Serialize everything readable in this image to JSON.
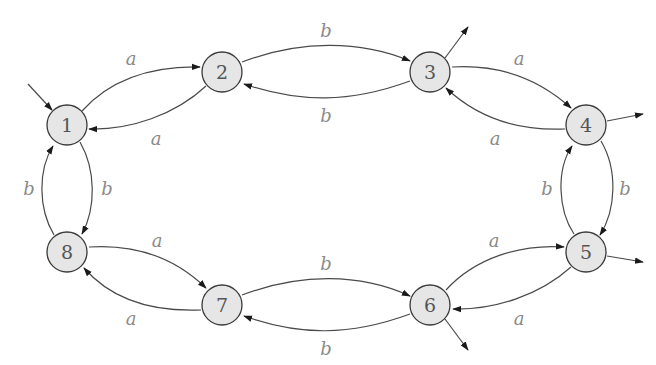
{
  "diagram": {
    "type": "finite-automaton",
    "colors": {
      "node_fill": "#e6e6e6",
      "node_stroke": "#3a3a3a",
      "edge_stroke": "#4a4a4a",
      "label_color": "#8a8a8a"
    },
    "states": [
      {
        "id": "1",
        "label": "1",
        "x": 67,
        "y": 125,
        "initial": true,
        "final": false
      },
      {
        "id": "2",
        "label": "2",
        "x": 222,
        "y": 72,
        "initial": false,
        "final": false
      },
      {
        "id": "3",
        "label": "3",
        "x": 430,
        "y": 72,
        "initial": false,
        "final": true
      },
      {
        "id": "4",
        "label": "4",
        "x": 586,
        "y": 125,
        "initial": false,
        "final": true
      },
      {
        "id": "5",
        "label": "5",
        "x": 586,
        "y": 252,
        "initial": false,
        "final": true
      },
      {
        "id": "6",
        "label": "6",
        "x": 430,
        "y": 305,
        "initial": false,
        "final": true
      },
      {
        "id": "7",
        "label": "7",
        "x": 222,
        "y": 305,
        "initial": false,
        "final": false
      },
      {
        "id": "8",
        "label": "8",
        "x": 67,
        "y": 252,
        "initial": false,
        "final": false
      }
    ],
    "transitions": [
      {
        "from": "1",
        "to": "2",
        "symbol": "a"
      },
      {
        "from": "2",
        "to": "1",
        "symbol": "a"
      },
      {
        "from": "2",
        "to": "3",
        "symbol": "b"
      },
      {
        "from": "3",
        "to": "2",
        "symbol": "b"
      },
      {
        "from": "3",
        "to": "4",
        "symbol": "a"
      },
      {
        "from": "4",
        "to": "3",
        "symbol": "a"
      },
      {
        "from": "4",
        "to": "5",
        "symbol": "b"
      },
      {
        "from": "5",
        "to": "4",
        "symbol": "b"
      },
      {
        "from": "6",
        "to": "5",
        "symbol": "a"
      },
      {
        "from": "5",
        "to": "6",
        "symbol": "a"
      },
      {
        "from": "7",
        "to": "6",
        "symbol": "b"
      },
      {
        "from": "6",
        "to": "7",
        "symbol": "b"
      },
      {
        "from": "8",
        "to": "7",
        "symbol": "a"
      },
      {
        "from": "7",
        "to": "8",
        "symbol": "a"
      },
      {
        "from": "1",
        "to": "8",
        "symbol": "b"
      },
      {
        "from": "8",
        "to": "1",
        "symbol": "b"
      }
    ],
    "edge_labels": [
      {
        "id": "l12",
        "text": "a",
        "x": 131,
        "y": 58
      },
      {
        "id": "l21",
        "text": "a",
        "x": 156,
        "y": 138
      },
      {
        "id": "l23",
        "text": "b",
        "x": 326,
        "y": 30
      },
      {
        "id": "l32",
        "text": "b",
        "x": 326,
        "y": 115
      },
      {
        "id": "l34",
        "text": "a",
        "x": 519,
        "y": 58
      },
      {
        "id": "l43",
        "text": "a",
        "x": 495,
        "y": 138
      },
      {
        "id": "l45",
        "text": "b",
        "x": 625,
        "y": 188
      },
      {
        "id": "l54",
        "text": "b",
        "x": 547,
        "y": 188
      },
      {
        "id": "l65",
        "text": "a",
        "x": 494,
        "y": 240
      },
      {
        "id": "l56",
        "text": "a",
        "x": 519,
        "y": 318
      },
      {
        "id": "l76",
        "text": "b",
        "x": 326,
        "y": 263
      },
      {
        "id": "l67",
        "text": "b",
        "x": 326,
        "y": 348
      },
      {
        "id": "l87",
        "text": "a",
        "x": 157,
        "y": 240
      },
      {
        "id": "l78",
        "text": "a",
        "x": 131,
        "y": 318
      },
      {
        "id": "l18",
        "text": "b",
        "x": 107,
        "y": 188
      },
      {
        "id": "l81",
        "text": "b",
        "x": 29,
        "y": 188
      }
    ]
  }
}
